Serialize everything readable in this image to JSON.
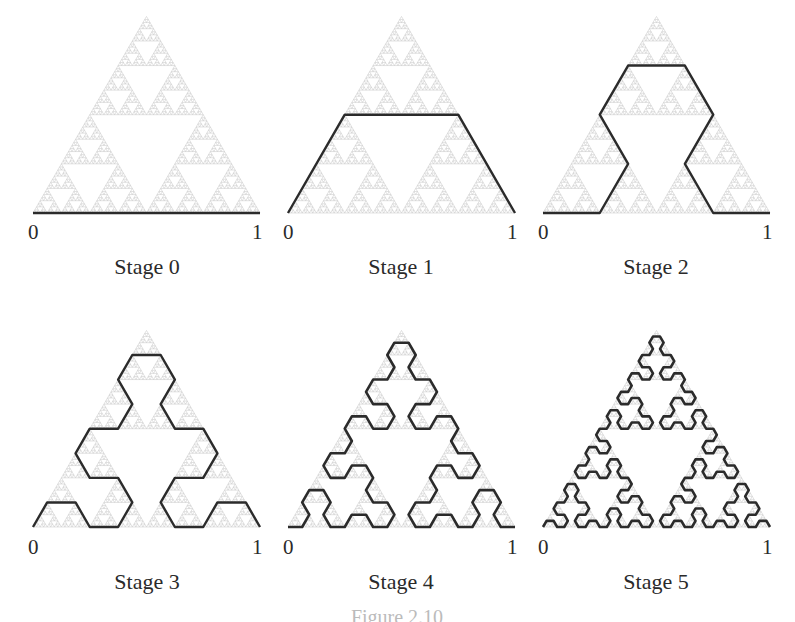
{
  "figure": {
    "caption": "Figure 2.10",
    "axis_start": "0",
    "axis_end": "1",
    "curve_color": "#2b2b2b",
    "background_color": "#c4c4c4",
    "panels": [
      {
        "label": "Stage 0",
        "stage": 0
      },
      {
        "label": "Stage 1",
        "stage": 1
      },
      {
        "label": "Stage 2",
        "stage": 2
      },
      {
        "label": "Stage 3",
        "stage": 3
      },
      {
        "label": "Stage 4",
        "stage": 4
      },
      {
        "label": "Stage 5",
        "stage": 5
      }
    ]
  }
}
